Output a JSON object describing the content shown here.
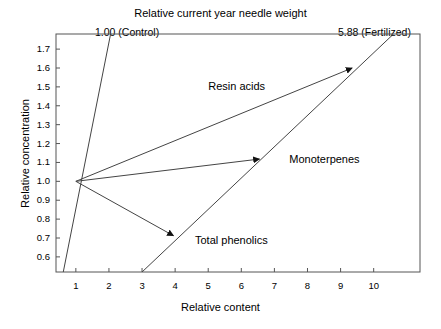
{
  "chart_data": {
    "type": "line",
    "title": "Relative current year needle weight",
    "xlabel": "Relative content",
    "ylabel": "Relative concentration",
    "xlim": [
      0.4,
      11.4
    ],
    "ylim": [
      0.52,
      1.78
    ],
    "xticks": [
      "1",
      "2",
      "3",
      "4",
      "5",
      "6",
      "7",
      "8",
      "9",
      "10"
    ],
    "xtick_values": [
      1,
      2,
      3,
      4,
      5,
      6,
      7,
      8,
      9,
      10
    ],
    "yticks": [
      "1.7",
      "1.6",
      "1.5",
      "1.4",
      "1.3",
      "1.2",
      "1.1",
      "1.0",
      "0.9",
      "0.8",
      "0.7",
      "0.6"
    ],
    "ytick_values": [
      1.7,
      1.6,
      1.5,
      1.4,
      1.3,
      1.2,
      1.1,
      1.0,
      0.9,
      0.8,
      0.7,
      0.6
    ],
    "grid": false,
    "legend_position": "inline-annotations",
    "origin_point": [
      1.0,
      1.0
    ],
    "top_axis_labels": [
      {
        "text": "1.00 (Control)",
        "x": 1.0
      },
      {
        "text": "5.88 (Fertilized)",
        "x": 10.35
      }
    ],
    "reference_lines": [
      {
        "name": "Control",
        "value": "1.00",
        "from": [
          0.62,
          0.52
        ],
        "to": [
          2.05,
          1.78
        ]
      },
      {
        "name": "Fertilized",
        "value": "5.88",
        "from": [
          3.0,
          0.52
        ],
        "to": [
          10.6,
          1.78
        ]
      }
    ],
    "series": [
      {
        "name": "Resin acids",
        "from": [
          1.0,
          1.0
        ],
        "to": [
          9.35,
          1.6
        ],
        "arrow": true,
        "label_x": 5.0,
        "label_y": 1.5
      },
      {
        "name": "Monoterpenes",
        "from": [
          1.0,
          1.0
        ],
        "to": [
          6.55,
          1.118
        ],
        "arrow": true,
        "label_x": 7.45,
        "label_y": 1.115
      },
      {
        "name": "Total phenolics",
        "from": [
          1.0,
          1.0
        ],
        "to": [
          3.95,
          0.712
        ],
        "arrow": true,
        "label_x": 4.6,
        "label_y": 0.685
      }
    ]
  },
  "style": {
    "axis_color": "#555555",
    "line_color": "#444444",
    "text_color": "#000000",
    "background": "#ffffff"
  }
}
